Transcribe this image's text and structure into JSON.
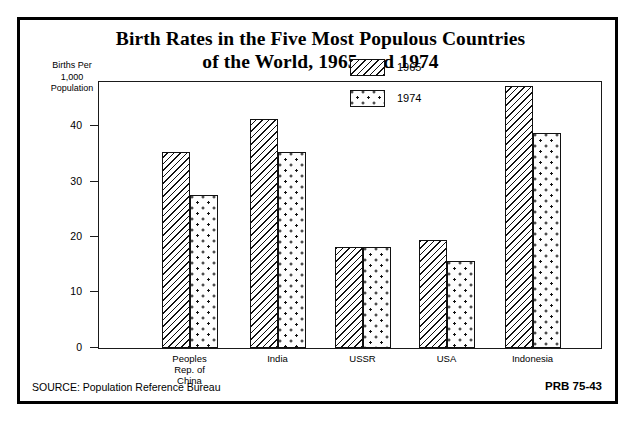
{
  "title": {
    "line1": "Birth Rates in the Five Most Populous Countries",
    "line2": "of the World, 1965 and 1974"
  },
  "axis_caption": {
    "line1": "Births Per",
    "line2": "1,000",
    "line3": "Population"
  },
  "legend": {
    "items": [
      {
        "label": "1965",
        "pattern": "diagonal-hatch"
      },
      {
        "label": "1974",
        "pattern": "stipple-dots"
      }
    ]
  },
  "footer": {
    "source": "SOURCE: Population Reference Bureau",
    "credit": "PRB 75-43"
  },
  "chart_data": {
    "type": "bar",
    "title": "Birth Rates in the Five Most Populous Countries of the World, 1965 and 1974",
    "xlabel": "",
    "ylabel": "Births Per 1,000 Population",
    "ylim": [
      0,
      48
    ],
    "yticks": [
      0,
      10,
      20,
      30,
      40
    ],
    "ytick_labels": [
      "0",
      "10",
      "20",
      "30",
      "40"
    ],
    "grid": false,
    "legend_position": "upper-center",
    "categories": [
      "Peoples Rep. of China",
      "India",
      "USSR",
      "USA",
      "Indonesia"
    ],
    "category_label_lines": [
      [
        "Peoples",
        "Rep. of",
        "China"
      ],
      [
        "India"
      ],
      [
        "USSR"
      ],
      [
        "USA"
      ],
      [
        "Indonesia"
      ]
    ],
    "series": [
      {
        "name": "1965",
        "values": [
          35.3,
          41.4,
          18.2,
          19.4,
          47.2
        ]
      },
      {
        "name": "1974",
        "values": [
          27.5,
          35.4,
          18.2,
          15.6,
          38.8
        ]
      }
    ]
  }
}
